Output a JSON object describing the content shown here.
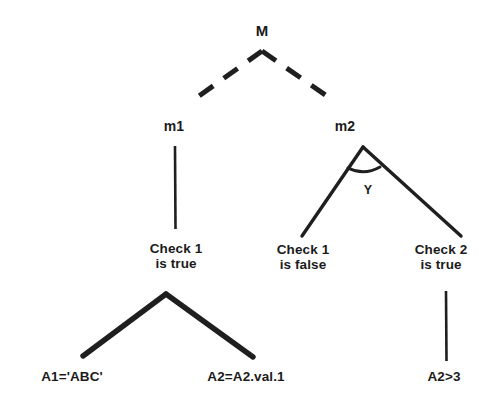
{
  "diagram": {
    "type": "tree",
    "title": "",
    "background_color": "#ffffff",
    "stroke_color": "#1b1b1b",
    "nodes": {
      "root": {
        "label": "M",
        "x": 262,
        "y": 31
      },
      "m1": {
        "label": "m1",
        "x": 174,
        "y": 127
      },
      "m2": {
        "label": "m2",
        "x": 345,
        "y": 127
      },
      "edge_marker_y": {
        "label": "Y",
        "x": 368,
        "y": 190
      },
      "check1_true": {
        "label": "Check 1\nis true",
        "x": 176,
        "y": 256
      },
      "check1_false": {
        "label": "Check 1\nis false",
        "x": 303,
        "y": 257
      },
      "check2_true": {
        "label": "Check 2\nis true",
        "x": 441,
        "y": 257
      },
      "leaf_a1": {
        "label": "A1='ABC'",
        "x": 72,
        "y": 377
      },
      "leaf_a2val": {
        "label": "A2=A2.val.1",
        "x": 246,
        "y": 377
      },
      "leaf_a2gt3": {
        "label": "A2>3",
        "x": 444,
        "y": 377
      }
    },
    "edges": [
      {
        "name": "root-to-m1",
        "style": "dashed",
        "from": "root",
        "to": "m1"
      },
      {
        "name": "root-to-m2",
        "style": "dashed",
        "from": "root",
        "to": "m2"
      },
      {
        "name": "m1-to-check1-true",
        "style": "solid",
        "from": "m1",
        "to": "check1_true"
      },
      {
        "name": "m2-to-check1-false",
        "style": "solid",
        "from": "m2",
        "to": "check1_false"
      },
      {
        "name": "m2-to-check2-true",
        "style": "solid",
        "from": "m2",
        "to": "check2_true"
      },
      {
        "name": "m2-branch-arc",
        "style": "arc",
        "from": "m2",
        "to": "m2"
      },
      {
        "name": "check1-true-to-a1",
        "style": "solid-thick",
        "from": "check1_true",
        "to": "leaf_a1"
      },
      {
        "name": "check1-true-to-a2val",
        "style": "solid-thick",
        "from": "check1_true",
        "to": "leaf_a2val"
      },
      {
        "name": "check2-true-to-a2gt3",
        "style": "solid",
        "from": "check2_true",
        "to": "leaf_a2gt3"
      }
    ]
  }
}
